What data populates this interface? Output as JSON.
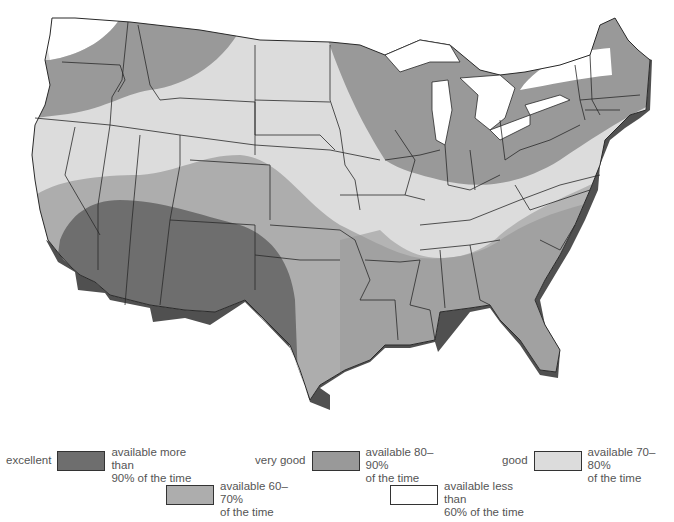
{
  "map": {
    "subject": "Contiguous United States availability zones",
    "colors": {
      "excellent": "#6e6e6e",
      "very_good": "#939393",
      "fair": "#a9a9a9",
      "good": "#dcdcdc",
      "poor": "#ffffff",
      "coast_shadow": "#505050",
      "border": "#2a2a2a"
    }
  },
  "legend": {
    "items": [
      {
        "rating": "excellent",
        "description": "available more than\n90% of the time",
        "color": "#6e6e6e"
      },
      {
        "rating": "very good",
        "description": "available 80–90%\nof the time",
        "color": "#999999"
      },
      {
        "rating": "good",
        "description": "available 70–80%\nof the time",
        "color": "#dcdcdc"
      },
      {
        "rating": "",
        "description": "available 60–70%\nof the time",
        "color": "#adadad"
      },
      {
        "rating": "",
        "description": "available less than\n60% of the time",
        "color": "#ffffff"
      }
    ]
  }
}
